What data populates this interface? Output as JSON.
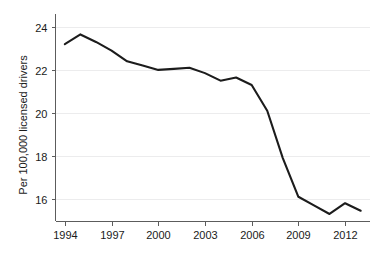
{
  "chart_data": {
    "type": "line",
    "title": "",
    "subtitle": "",
    "xlabel": "",
    "ylabel": "Per 100,000 licensed drivers",
    "xlim": [
      1993.4,
      2013.6
    ],
    "ylim": [
      14.95,
      24.6
    ],
    "grid": true,
    "grid_axis": "y",
    "legend": false,
    "legend_position": "none",
    "line_color": "#1c1c1c",
    "grid_color": "#ececed",
    "axis_color": "#5c5c5c",
    "background_color": "#ffffff",
    "x": [
      1994,
      1995,
      1996,
      1997,
      1998,
      1999,
      2000,
      2001,
      2002,
      2003,
      2004,
      2005,
      2006,
      2007,
      2008,
      2009,
      2010,
      2011,
      2012,
      2013
    ],
    "xticks": [
      1994,
      1997,
      2000,
      2003,
      2006,
      2009,
      2012
    ],
    "xticklabels": [
      "1994",
      "1997",
      "2000",
      "2003",
      "2006",
      "2009",
      "2012"
    ],
    "yticks": [
      16,
      18,
      20,
      22,
      24
    ],
    "yticklabels": [
      "16",
      "18",
      "20",
      "22",
      "24"
    ],
    "series": [
      {
        "name": "Per 100,000 licensed drivers",
        "color": "#1c1c1c",
        "values": [
          23.2,
          23.65,
          23.3,
          22.9,
          22.4,
          22.2,
          22.0,
          22.05,
          22.1,
          21.85,
          21.5,
          21.65,
          21.3,
          20.1,
          17.9,
          16.1,
          15.7,
          15.3,
          15.8,
          15.45
        ]
      }
    ],
    "annotations": []
  }
}
